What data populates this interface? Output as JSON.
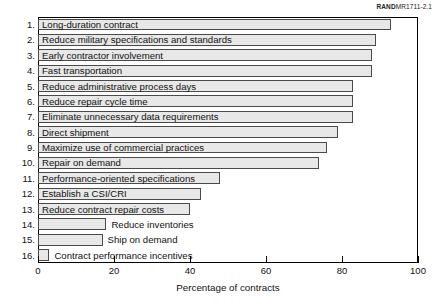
{
  "figure_id": {
    "brand": "RAND",
    "code": "MR1711-2.1"
  },
  "chart_data": {
    "type": "bar",
    "orientation": "horizontal",
    "title": "",
    "xlabel": "Percentage of contracts",
    "ylabel": "",
    "xlim": [
      0,
      100
    ],
    "xticks": [
      0,
      20,
      40,
      60,
      80,
      100
    ],
    "grid": false,
    "legend": null,
    "categories": [
      "Long-duration contract",
      "Reduce military specifications and standards",
      "Early contractor involvement",
      "Fast transportation",
      "Reduce administrative process days",
      "Reduce repair cycle time",
      "Eliminate unnecessary data requirements",
      "Direct shipment",
      "Maximize use of commercial practices",
      "Repair on demand",
      "Performance-oriented specifications",
      "Establish a CSI/CRI",
      "Reduce contract repair costs",
      "Reduce inventories",
      "Ship on demand",
      "Contract performance incentives"
    ],
    "numbers": [
      "1.",
      "2.",
      "3.",
      "4.",
      "5.",
      "6.",
      "7.",
      "8.",
      "9.",
      "10.",
      "11.",
      "12.",
      "13.",
      "14.",
      "15.",
      "16."
    ],
    "values": [
      93,
      89,
      88,
      88,
      83,
      83,
      83,
      79,
      76,
      74,
      48,
      43,
      40,
      18,
      17,
      3
    ],
    "label_placement": [
      "inside",
      "inside",
      "inside",
      "inside",
      "inside",
      "inside",
      "inside",
      "inside",
      "inside",
      "inside",
      "inside",
      "inside",
      "inside",
      "outside",
      "outside",
      "outside"
    ],
    "bar_fill": "#e8e8e8",
    "bar_edge": "#4a4a4a"
  }
}
